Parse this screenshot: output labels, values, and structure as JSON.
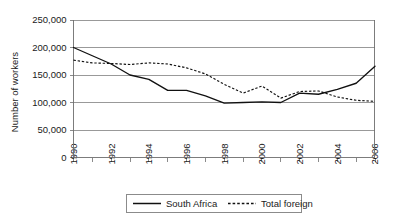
{
  "chart_data": {
    "type": "line",
    "title": "",
    "xlabel": "",
    "ylabel": "Number of workers",
    "xlim": [
      1990,
      2006
    ],
    "ylim": [
      0,
      250000
    ],
    "ytick_labels": [
      "250,000",
      "200,000",
      "150,000",
      "100,000",
      "50,000",
      "0"
    ],
    "ytick_values": [
      250000,
      200000,
      150000,
      100000,
      50000,
      0
    ],
    "xtick_labels": [
      "1990",
      "1992",
      "1994",
      "1996",
      "1998",
      "2000",
      "2002",
      "2004",
      "2006"
    ],
    "xtick_values": [
      1990,
      1992,
      1994,
      1996,
      1998,
      2000,
      2002,
      2004,
      2006
    ],
    "x": [
      1990,
      1991,
      1992,
      1993,
      1994,
      1995,
      1996,
      1997,
      1998,
      1999,
      2000,
      2001,
      2002,
      2003,
      2004,
      2005,
      2006
    ],
    "grid": true,
    "legend_position": "bottom",
    "series": [
      {
        "name": "South Africa",
        "style": "solid",
        "values": [
          200000,
          185000,
          170000,
          150000,
          142000,
          122000,
          122000,
          112000,
          99000,
          100000,
          101000,
          100000,
          117000,
          115000,
          124000,
          135000,
          166000
        ]
      },
      {
        "name": "Total foreign",
        "style": "dashed",
        "values": [
          177000,
          172000,
          171000,
          169000,
          172000,
          170000,
          163000,
          152000,
          133000,
          117000,
          130000,
          108000,
          120000,
          121000,
          110000,
          104000,
          102000
        ]
      }
    ]
  },
  "legend": {
    "items": [
      {
        "label": "South Africa",
        "style": "solid"
      },
      {
        "label": "Total foreign",
        "style": "dashed"
      }
    ]
  }
}
